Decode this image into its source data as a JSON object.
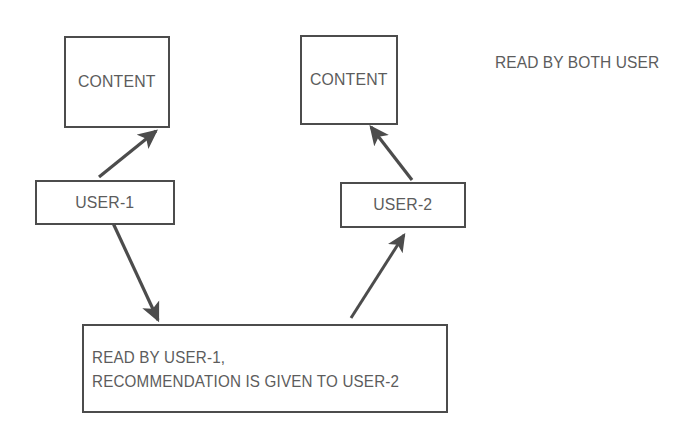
{
  "diagram": {
    "title_label": "READ BY BOTH USER",
    "background_color": "#ffffff",
    "stroke_color": "#4c4c4c",
    "text_color": "#5c5c5c",
    "nodes": [
      {
        "id": "content-1",
        "label": "CONTENT",
        "x": 64,
        "y": 36,
        "w": 106,
        "h": 92
      },
      {
        "id": "content-2",
        "label": "CONTENT",
        "x": 300,
        "y": 35,
        "w": 98,
        "h": 90
      },
      {
        "id": "user-1",
        "label": "USER-1",
        "x": 35,
        "y": 180,
        "w": 140,
        "h": 45
      },
      {
        "id": "user-2",
        "label": "USER-2",
        "x": 340,
        "y": 182,
        "w": 126,
        "h": 46
      },
      {
        "id": "recommendation",
        "label": "READ BY USER-1,\nRECOMMENDATION IS GIVEN TO USER-2",
        "line_1": "READ BY USER-1,",
        "line_2": "RECOMMENDATION IS GIVEN TO USER-2",
        "x": 82,
        "y": 324,
        "w": 366,
        "h": 89
      }
    ],
    "annotations": [
      {
        "id": "read-by-both",
        "text": "READ BY BOTH USER",
        "x": 495,
        "y": 53
      }
    ],
    "edges": [
      {
        "id": "user1-to-content1",
        "from": "user-1",
        "to": "content-1",
        "x1": 99,
        "y1": 177,
        "x2": 156,
        "y2": 131
      },
      {
        "id": "user1-to-recommendation",
        "from": "user-1",
        "to": "recommendation",
        "x1": 113,
        "y1": 223,
        "x2": 158,
        "y2": 320
      },
      {
        "id": "user2-to-content2",
        "from": "user-2",
        "to": "content-2",
        "x1": 412,
        "y1": 180,
        "x2": 371,
        "y2": 127
      },
      {
        "id": "recommendation-to-user2",
        "from": "recommendation",
        "to": "user-2",
        "x1": 351,
        "y1": 318,
        "x2": 404,
        "y2": 235
      }
    ]
  }
}
